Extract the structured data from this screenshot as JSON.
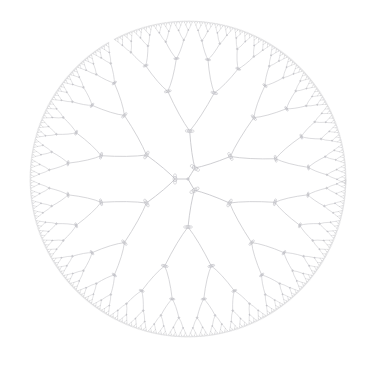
{
  "diagram": {
    "type": "hyperbolic-radial-tree",
    "background": "#ffffff",
    "edge_color": "#c8c8cc",
    "node_color": "#bcbcc2",
    "canvas": {
      "width": 375,
      "height": 366
    },
    "center": {
      "x": 188,
      "y": 179
    },
    "disk_radius": 158,
    "root_children": 3,
    "branching_factor": 2,
    "depth": 10,
    "root_angles_deg": [
      -58,
      180,
      60
    ],
    "level_radii": [
      0,
      13,
      48,
      90,
      121,
      139,
      149,
      154,
      156.5,
      157.5,
      158
    ]
  }
}
